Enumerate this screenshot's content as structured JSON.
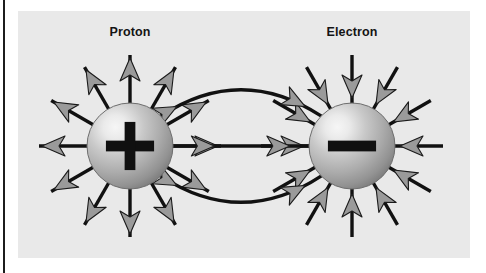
{
  "figure": {
    "canvas": {
      "width": 486,
      "height": 273,
      "background": "#ffffff"
    },
    "panel": {
      "name": "diagram-panel",
      "x": 18,
      "y": 11,
      "width": 452,
      "height": 247,
      "fill": "#e9e9e9"
    },
    "left_rule": {
      "name": "left-margin-rule",
      "x": 3,
      "y": 0,
      "width": 2,
      "height": 273,
      "color": "#1c1c1c"
    }
  },
  "labels": [
    {
      "id": "proton-label",
      "text": "Proton",
      "x": 130,
      "y": 36
    },
    {
      "id": "electron-label",
      "text": "Electron",
      "x": 352,
      "y": 36
    }
  ],
  "particles": [
    {
      "id": "proton",
      "name": "Proton",
      "sign": "+",
      "cx": 130,
      "cy": 146,
      "r": 43,
      "charge_polarity": "positive",
      "field_direction": "outward",
      "radial_ray_count": 12,
      "colors": {
        "highlight": "#f4f4f4",
        "mid": "#b9b9b9",
        "shadow": "#8c8c8c",
        "edge": "#6e6e6e",
        "symbol": "#101010"
      }
    },
    {
      "id": "electron",
      "name": "Electron",
      "sign": "−",
      "cx": 352,
      "cy": 146,
      "r": 43,
      "charge_polarity": "negative",
      "field_direction": "inward",
      "radial_ray_count": 12,
      "colors": {
        "highlight": "#f4f4f4",
        "mid": "#b9b9b9",
        "shadow": "#8c8c8c",
        "edge": "#6e6e6e",
        "symbol": "#101010"
      }
    }
  ],
  "field_lines": {
    "count": 3,
    "direction": "proton-to-electron",
    "arrowheads_per_line": 2,
    "paths": [
      {
        "id": "field-line-upper",
        "shape": "curve",
        "bow": -42
      },
      {
        "id": "field-line-middle",
        "shape": "straight",
        "bow": 0
      },
      {
        "id": "field-line-lower",
        "shape": "curve",
        "bow": 42
      }
    ]
  },
  "style": {
    "line_color": "#111111",
    "line_width": 3.4,
    "arrow_fill": "#9a9a9a",
    "arrow_stroke": "#1a1a1a",
    "arrow_stroke_width": 1.1,
    "arrow_length": 23,
    "arrow_half_width": 10,
    "arrow_notch": 6
  }
}
